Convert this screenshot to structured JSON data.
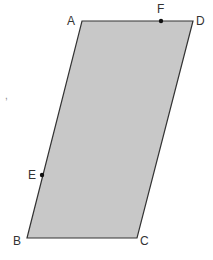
{
  "diagram": {
    "type": "parallelogram",
    "fill": "#c8c8c8",
    "stroke": "#333333",
    "vertices": {
      "A": {
        "label": "A",
        "x": 82,
        "y": 21
      },
      "D": {
        "label": "D",
        "x": 193,
        "y": 21
      },
      "C": {
        "label": "C",
        "x": 137,
        "y": 238
      },
      "B": {
        "label": "B",
        "x": 27,
        "y": 238
      }
    },
    "points": {
      "E": {
        "label": "E",
        "x": 42,
        "y": 175,
        "on_side": "AB"
      },
      "F": {
        "label": "F",
        "x": 161,
        "y": 21,
        "on_side": "AD"
      }
    },
    "stray_mark": ","
  }
}
